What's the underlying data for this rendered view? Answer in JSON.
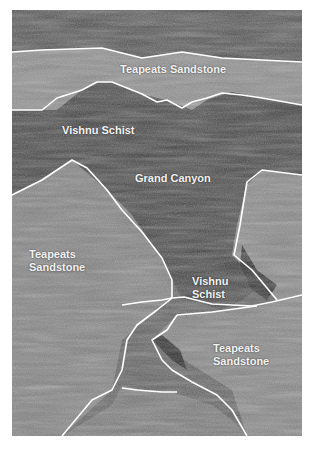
{
  "figure": {
    "type": "aerial photograph (grayscale) with geologic unit boundaries",
    "labels": [
      {
        "id": "teapeats-top",
        "text": "Teapeats Sandstone"
      },
      {
        "id": "vishnu-top",
        "text": "Vishnu Schist"
      },
      {
        "id": "grand-canyon",
        "text": "Grand Canyon"
      },
      {
        "id": "teapeats-left-1",
        "text": "Teapeats"
      },
      {
        "id": "teapeats-left-2",
        "text": "Sandstone"
      },
      {
        "id": "vishnu-mid-1",
        "text": "Vishnu"
      },
      {
        "id": "vishnu-mid-2",
        "text": "Schist"
      },
      {
        "id": "teapeats-right-1",
        "text": "Teapeats"
      },
      {
        "id": "teapeats-right-2",
        "text": "Sandstone"
      }
    ],
    "colors": {
      "boundary_line": "#ffffff",
      "label_text": "#f2f2f2"
    }
  }
}
